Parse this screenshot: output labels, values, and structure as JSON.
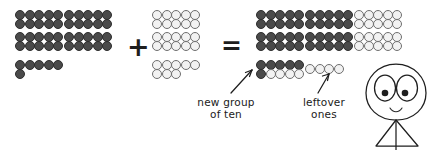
{
  "scene": {
    "title": "Place-value addition with dot groups",
    "background_color": "#ffffff",
    "filled_dot_color": "#4a4a4a",
    "open_dot_color": "#f2f2f2",
    "ink_color": "#1e1e1e"
  },
  "equation": {
    "plus_symbol": "+",
    "equals_symbol": "=",
    "left_addend_value": 46,
    "right_addend_value": 28,
    "sum_value": 74
  },
  "left_addend": {
    "name": "left-addend",
    "dot_style": "filled",
    "tens_groups": 4,
    "tens_layout": "2 columns x 2 rows of ten-frames",
    "ten_frame_rows": 2,
    "ten_frame_cols": 5,
    "loose_ones": 6,
    "loose_ones_layout": "5 in a row plus 1 below the first"
  },
  "right_addend": {
    "name": "right-addend",
    "dot_style": "open",
    "tens_groups": 2,
    "tens_layout": "1 column x 2 rows of ten-frames",
    "ten_frame_rows": 2,
    "ten_frame_cols": 5,
    "loose_ones": 8,
    "loose_ones_layout": "5 on top row, 3 on bottom row"
  },
  "result": {
    "name": "sum-result",
    "rows": [
      {
        "groups": [
          "filled-ten",
          "filled-ten",
          "open-ten"
        ]
      },
      {
        "groups": [
          "filled-ten",
          "filled-ten",
          "open-ten"
        ]
      },
      {
        "groups": [
          "mixed-new-ten",
          "leftover-ones"
        ]
      }
    ],
    "filled_tens": 4,
    "open_tens": 2,
    "new_group_of_ten": {
      "top_row_filled": 5,
      "bottom_row_filled": 1,
      "bottom_row_open": 4,
      "total": 10
    },
    "leftover_ones": 4
  },
  "annotations": [
    {
      "id": "new-group-of-ten",
      "text": "new group\nof ten",
      "points_to": "mixed-new-ten-group",
      "arrow": "diagonal up-right"
    },
    {
      "id": "leftover-ones",
      "text": "leftover\nones",
      "points_to": "leftover-open-ones",
      "arrow": "diagonal up-right"
    }
  ],
  "doodle": {
    "id": "smiley-stick-figure",
    "description": "hand-drawn round face with two large eyes, small smile, and a triangular body"
  }
}
